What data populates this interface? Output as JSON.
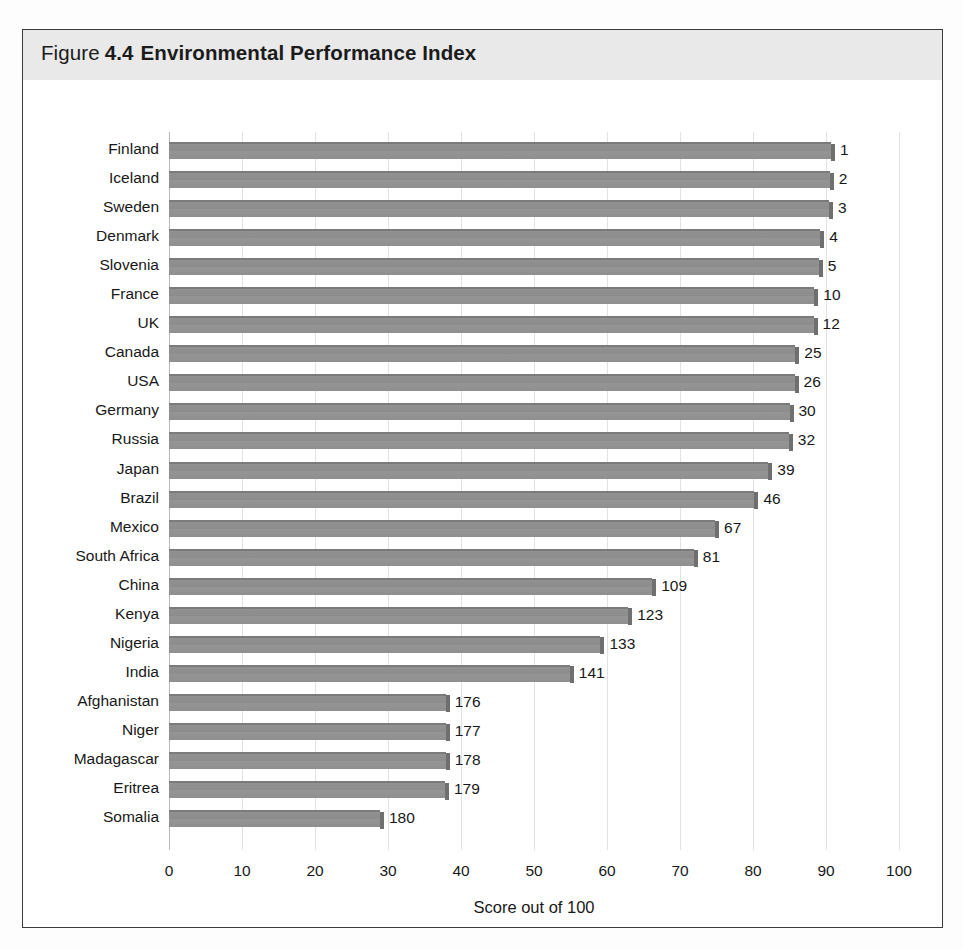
{
  "figure": {
    "label_word": "Figure",
    "number": "4.4",
    "name": "Environmental Performance Index"
  },
  "chart_data": {
    "type": "bar",
    "orientation": "horizontal",
    "xlabel": "Score out of 100",
    "ylabel": "",
    "xlim": [
      0,
      100
    ],
    "xticks": [
      "0",
      "10",
      "20",
      "30",
      "40",
      "50",
      "60",
      "70",
      "80",
      "90",
      "100"
    ],
    "xtick_values": [
      0,
      10,
      20,
      30,
      40,
      50,
      60,
      70,
      80,
      90,
      100
    ],
    "grid": "vertical",
    "legend": "none",
    "value_label_note": "Number at the end of each bar is the country's world rank",
    "categories": [
      "Finland",
      "Iceland",
      "Sweden",
      "Denmark",
      "Slovenia",
      "France",
      "UK",
      "Canada",
      "USA",
      "Germany",
      "Russia",
      "Japan",
      "Brazil",
      "Mexico",
      "South Africa",
      "China",
      "Kenya",
      "Nigeria",
      "India",
      "Afghanistan",
      "Niger",
      "Madagascar",
      "Eritrea",
      "Somalia"
    ],
    "values": [
      90.7,
      90.5,
      90.4,
      89.2,
      89.0,
      88.4,
      88.3,
      85.8,
      85.7,
      85.0,
      84.9,
      82.1,
      80.2,
      74.8,
      71.9,
      66.2,
      62.9,
      59.1,
      54.9,
      37.9,
      37.9,
      37.9,
      37.8,
      28.9
    ],
    "rank_labels": [
      "1",
      "2",
      "3",
      "4",
      "5",
      "10",
      "12",
      "25",
      "26",
      "30",
      "32",
      "39",
      "46",
      "67",
      "81",
      "109",
      "123",
      "133",
      "141",
      "176",
      "177",
      "178",
      "179",
      "180"
    ],
    "bars": [
      {
        "country": "Finland",
        "score": 90.7,
        "rank": "1"
      },
      {
        "country": "Iceland",
        "score": 90.5,
        "rank": "2"
      },
      {
        "country": "Sweden",
        "score": 90.4,
        "rank": "3"
      },
      {
        "country": "Denmark",
        "score": 89.2,
        "rank": "4"
      },
      {
        "country": "Slovenia",
        "score": 89.0,
        "rank": "5"
      },
      {
        "country": "France",
        "score": 88.4,
        "rank": "10"
      },
      {
        "country": "UK",
        "score": 88.3,
        "rank": "12"
      },
      {
        "country": "Canada",
        "score": 85.8,
        "rank": "25"
      },
      {
        "country": "USA",
        "score": 85.7,
        "rank": "26"
      },
      {
        "country": "Germany",
        "score": 85.0,
        "rank": "30"
      },
      {
        "country": "Russia",
        "score": 84.9,
        "rank": "32"
      },
      {
        "country": "Japan",
        "score": 82.1,
        "rank": "39"
      },
      {
        "country": "Brazil",
        "score": 80.2,
        "rank": "46"
      },
      {
        "country": "Mexico",
        "score": 74.8,
        "rank": "67"
      },
      {
        "country": "South Africa",
        "score": 71.9,
        "rank": "81"
      },
      {
        "country": "China",
        "score": 66.2,
        "rank": "109"
      },
      {
        "country": "Kenya",
        "score": 62.9,
        "rank": "123"
      },
      {
        "country": "Nigeria",
        "score": 59.1,
        "rank": "133"
      },
      {
        "country": "India",
        "score": 54.9,
        "rank": "141"
      },
      {
        "country": "Afghanistan",
        "score": 37.9,
        "rank": "176"
      },
      {
        "country": "Niger",
        "score": 37.9,
        "rank": "177"
      },
      {
        "country": "Madagascar",
        "score": 37.9,
        "rank": "178"
      },
      {
        "country": "Eritrea",
        "score": 37.8,
        "rank": "179"
      },
      {
        "country": "Somalia",
        "score": 28.9,
        "rank": "180"
      }
    ],
    "colors": {
      "bar_fill": "#8f8f8f",
      "bar_edge": "#6f6f6f",
      "grid": "#e2e2e2",
      "header_band": "#e9e9e9",
      "frame": "#3b3b3b",
      "text": "#181818"
    }
  }
}
